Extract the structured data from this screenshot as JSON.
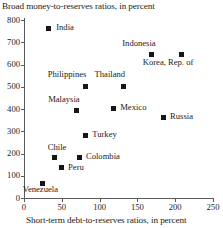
{
  "chart_data": {
    "type": "scatter",
    "title": "Broad money-to-reserves ratios, in percent",
    "xlabel": "Short-term debt-to-reserves ratios, in percent",
    "ylabel": "Broad money-to-reserves ratios, in percent",
    "xlim": [
      0,
      250
    ],
    "ylim": [
      0,
      800
    ],
    "xticks": [
      0,
      50,
      100,
      150,
      200,
      250
    ],
    "yticks": [
      0,
      100,
      200,
      300,
      400,
      500,
      600,
      700,
      800
    ],
    "grid": false,
    "legend": "none",
    "points": [
      {
        "label": "India",
        "x": 32,
        "y": 764,
        "label_dx": 8,
        "label_dy": -1
      },
      {
        "label": "Indonesia",
        "x": 169,
        "y": 643,
        "label_dx": -21,
        "label_dy": -12
      },
      {
        "label": "Korea, Rep. of",
        "x": 208,
        "y": 643,
        "label_dx": -21,
        "label_dy": 7
      },
      {
        "label": "Philippines",
        "x": 81,
        "y": 503,
        "label_dx": -26,
        "label_dy": -12
      },
      {
        "label": "Thailand",
        "x": 131,
        "y": 499,
        "label_dx": -21,
        "label_dy": -13
      },
      {
        "label": "Malaysia",
        "x": 69,
        "y": 395,
        "label_dx": -20,
        "label_dy": -11
      },
      {
        "label": "Mexico",
        "x": 118,
        "y": 404,
        "label_dx": 7,
        "label_dy": -1
      },
      {
        "label": "Russia",
        "x": 184,
        "y": 364,
        "label_dx": 7,
        "label_dy": -1
      },
      {
        "label": "Turkey",
        "x": 81,
        "y": 283,
        "label_dx": 7,
        "label_dy": -1
      },
      {
        "label": "Chile",
        "x": 40,
        "y": 180,
        "label_dx": -5,
        "label_dy": -11
      },
      {
        "label": "Colombia",
        "x": 74,
        "y": 184,
        "label_dx": 6,
        "label_dy": -1
      },
      {
        "label": "Peru",
        "x": 49,
        "y": 135,
        "label_dx": 7,
        "label_dy": -1
      },
      {
        "label": "Venezuela",
        "x": 24,
        "y": 67,
        "label_dx": -10,
        "label_dy": 6
      }
    ]
  },
  "axes": {
    "ytick_labels": [
      "800",
      "700",
      "600",
      "500",
      "400",
      "300",
      "200",
      "100",
      "0"
    ],
    "xtick_labels": [
      "0",
      "50",
      "100",
      "150",
      "200",
      "250"
    ]
  }
}
